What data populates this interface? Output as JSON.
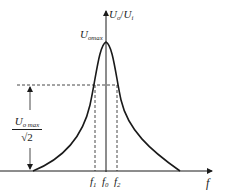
{
  "diagram": {
    "y_axis_label": {
      "main": "U",
      "sub1": "o",
      "sep": "/",
      "main2": "U",
      "sub2": "i"
    },
    "x_axis_label": "f",
    "peak_label": {
      "main": "U",
      "sub": "omax"
    },
    "half_power_label": {
      "numerator_main": "U",
      "numerator_sub": "o max",
      "denominator": "√2"
    },
    "ticks": [
      {
        "main": "f",
        "sub": "1"
      },
      {
        "main": "f",
        "sub": "0"
      },
      {
        "main": "f",
        "sub": "2"
      }
    ],
    "colors": {
      "line": "#1a1a1a",
      "background": "#ffffff"
    }
  }
}
